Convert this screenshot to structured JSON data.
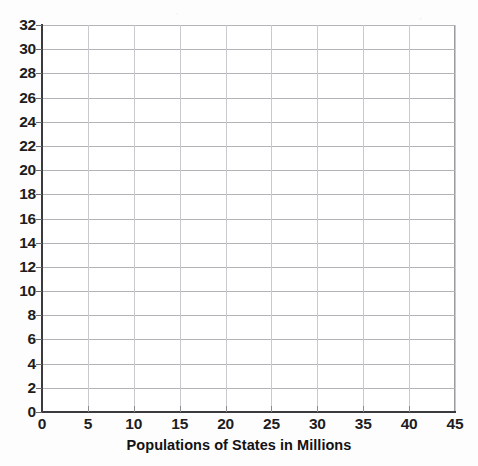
{
  "chart_data": {
    "type": "scatter",
    "title": "",
    "subtitle": "",
    "xlabel": "Populations of States in Millions",
    "ylabel": "",
    "xlim": [
      0,
      45
    ],
    "ylim": [
      0,
      32
    ],
    "x_ticks": [
      0,
      5,
      10,
      15,
      20,
      25,
      30,
      35,
      40,
      45
    ],
    "y_ticks": [
      0,
      2,
      4,
      6,
      8,
      10,
      12,
      14,
      16,
      18,
      20,
      22,
      24,
      26,
      28,
      30,
      32
    ],
    "x_tick_labels": [
      "0",
      "5",
      "10",
      "15",
      "20",
      "25",
      "30",
      "35",
      "40",
      "45"
    ],
    "y_tick_labels": [
      "0",
      "2",
      "4",
      "6",
      "8",
      "10",
      "12",
      "14",
      "16",
      "18",
      "20",
      "22",
      "24",
      "26",
      "28",
      "30",
      "32"
    ],
    "x_tick_step": 5,
    "y_tick_step": 2,
    "grid": true,
    "grid_axes": "both",
    "legend": false,
    "legend_position": "none",
    "series": [],
    "values": [],
    "annotations": [],
    "note": "Empty grid / blank plotting template with no plotted data points"
  },
  "axes": {
    "x_title": "Populations of States in Millions",
    "y_title": "",
    "x_labels": [
      "0",
      "5",
      "10",
      "15",
      "20",
      "25",
      "30",
      "35",
      "40",
      "45"
    ],
    "y_labels": [
      "32",
      "30",
      "28",
      "26",
      "24",
      "22",
      "20",
      "18",
      "16",
      "14",
      "12",
      "10",
      "8",
      "6",
      "4",
      "2",
      "0"
    ]
  },
  "colors": {
    "background": "#fdfdfd",
    "plot_background": "#ffffff",
    "axis_line": "#3b3b3f",
    "grid_horizontal": "#b4b4b8",
    "grid_vertical": "#c9c9cf",
    "label_text": "#1d1d1f",
    "title_text": "#121214"
  }
}
